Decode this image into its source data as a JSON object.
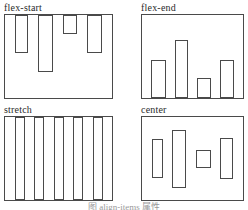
{
  "figure": {
    "caption": "图  align-items 属性",
    "background": "#ffffff",
    "line_color": "#4a4a4a",
    "label_color": "#2a2a2a",
    "caption_color": "#9a9a9a"
  },
  "panels": [
    {
      "id": "flex-start",
      "label": "flex-start",
      "align": "flex-start",
      "bars": [
        {
          "w": 13,
          "h": 38
        },
        {
          "w": 15,
          "h": 57
        },
        {
          "w": 14,
          "h": 19
        },
        {
          "w": 15,
          "h": 38
        }
      ]
    },
    {
      "id": "flex-end",
      "label": "flex-end",
      "align": "flex-end",
      "bars": [
        {
          "w": 15,
          "h": 38
        },
        {
          "w": 13,
          "h": 58
        },
        {
          "w": 14,
          "h": 20
        },
        {
          "w": 14,
          "h": 38
        }
      ]
    },
    {
      "id": "stretch",
      "label": "stretch",
      "align": "stretch",
      "bars": [
        {
          "w": 10
        },
        {
          "w": 10
        },
        {
          "w": 10
        },
        {
          "w": 10
        },
        {
          "w": 10
        }
      ]
    },
    {
      "id": "center",
      "label": "center",
      "align": "center",
      "bars": [
        {
          "w": 11,
          "h": 39
        },
        {
          "w": 14,
          "h": 58
        },
        {
          "w": 15,
          "h": 18
        },
        {
          "w": 13,
          "h": 41
        }
      ]
    }
  ]
}
